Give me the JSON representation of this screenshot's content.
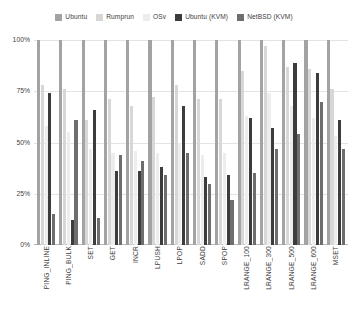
{
  "chart_data": {
    "type": "bar",
    "title": "",
    "xlabel": "",
    "ylabel": "",
    "ylim": [
      0,
      100
    ],
    "grid": true,
    "legend_position": "top-center",
    "y_ticks": [
      "0%",
      "25%",
      "50%",
      "75%",
      "100%"
    ],
    "y_tick_values": [
      0,
      25,
      50,
      75,
      100
    ],
    "categories": [
      "PING_INLINE",
      "PING_BULK",
      "SET",
      "GET",
      "INCR",
      "LPUSH",
      "LPOP",
      "SADD",
      "SPOP",
      "LRANGE_100",
      "LRANGE_300",
      "LRANGE_500",
      "LRANGE_600",
      "MSET"
    ],
    "series": [
      {
        "name": "Ubuntu",
        "color": "#a3a3a3",
        "values": [
          100,
          100,
          100,
          100,
          100,
          100,
          100,
          100,
          100,
          100,
          100,
          100,
          100,
          100
        ]
      },
      {
        "name": "Rumprun",
        "color": "#d7d7d7",
        "values": [
          78,
          76,
          61,
          71,
          68,
          72,
          78,
          71,
          71,
          85,
          97,
          87,
          86,
          76
        ]
      },
      {
        "name": "OSv",
        "color": "#ededed",
        "values": [
          58,
          55,
          47,
          45,
          46,
          45,
          50,
          44,
          45,
          63,
          74,
          68,
          62,
          53
        ]
      },
      {
        "name": "Ubuntu (KVM)",
        "color": "#3c3c3c",
        "values": [
          74,
          12,
          66,
          36,
          36,
          38,
          68,
          33,
          34,
          62,
          57,
          89,
          84,
          61
        ]
      },
      {
        "name": "NetBSD (KVM)",
        "color": "#6e6e6e",
        "values": [
          15,
          61,
          13,
          44,
          41,
          34,
          45,
          30,
          22,
          35,
          47,
          54,
          70,
          47
        ]
      }
    ]
  },
  "legend": {
    "items": [
      {
        "label": "Ubuntu",
        "color": "#a3a3a3"
      },
      {
        "label": "Rumprun",
        "color": "#d7d7d7"
      },
      {
        "label": "OSv",
        "color": "#ededed"
      },
      {
        "label": "Ubuntu (KVM)",
        "color": "#3c3c3c"
      },
      {
        "label": "NetBSD (KVM)",
        "color": "#6e6e6e"
      }
    ]
  }
}
